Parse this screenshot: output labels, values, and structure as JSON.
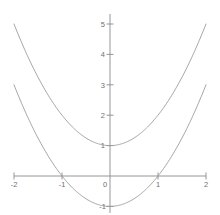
{
  "chart_data": {
    "type": "line",
    "title": "",
    "subtitle": "",
    "xlabel": "",
    "ylabel": "",
    "xlim": [
      -2,
      2
    ],
    "ylim": [
      -1.35,
      5.3
    ],
    "grid": false,
    "legend": "none",
    "axis_style": "centered-cartesian",
    "xticks": [
      -2,
      -1,
      0,
      1,
      2
    ],
    "xtick_labels": [
      "-2",
      "-1",
      "0",
      "1",
      "2"
    ],
    "yticks": [
      1,
      2,
      3,
      4,
      5
    ],
    "ytick_labels": [
      "1",
      "2",
      "3",
      "4",
      "5"
    ],
    "ytick_below_axis": [
      -1
    ],
    "ytick_below_labels": [
      "-1"
    ],
    "series": [
      {
        "name": "y = x^2 + 1",
        "vertex": [
          0,
          1
        ],
        "a": 1,
        "c": 1,
        "x": [
          -2,
          -1.75,
          -1.5,
          -1.25,
          -1,
          -0.75,
          -0.5,
          -0.25,
          0,
          0.25,
          0.5,
          0.75,
          1,
          1.25,
          1.5,
          1.75,
          2
        ],
        "values": [
          5,
          4.0625,
          3.25,
          2.5625,
          2,
          1.5625,
          1.25,
          1.0625,
          1,
          1.0625,
          1.25,
          1.5625,
          2,
          2.5625,
          3.25,
          4.0625,
          5
        ]
      },
      {
        "name": "y = x^2 - 1",
        "vertex": [
          0,
          -1
        ],
        "a": 1,
        "c": -1,
        "roots": [
          -1,
          1
        ],
        "x": [
          -2,
          -1.75,
          -1.5,
          -1.25,
          -1,
          -0.75,
          -0.5,
          -0.25,
          0,
          0.25,
          0.5,
          0.75,
          1,
          1.25,
          1.5,
          1.75,
          2
        ],
        "values": [
          3,
          2.0625,
          1.25,
          0.5625,
          0,
          -0.4375,
          -0.75,
          -0.9375,
          -1,
          -0.9375,
          -0.75,
          -0.4375,
          0,
          0.5625,
          1.25,
          2.0625,
          3
        ]
      }
    ]
  },
  "colors": {
    "background": "#ffffff",
    "axis": "#8a8a8a",
    "curve": "#9a9a9a",
    "tick_text": "#6f6f6f"
  }
}
